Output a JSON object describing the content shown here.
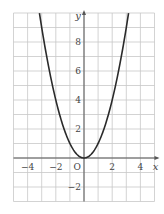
{
  "chart_data": {
    "type": "line",
    "title": "",
    "function": "y = x^2",
    "xlabel": "x",
    "ylabel": "y",
    "origin_label": "O",
    "xlim": [
      -5,
      5
    ],
    "ylim": [
      -3,
      10
    ],
    "grid": true,
    "grid_step": 1,
    "x_ticks": [
      {
        "value": -4,
        "label": "−4"
      },
      {
        "value": -2,
        "label": "−2"
      },
      {
        "value": 2,
        "label": "2"
      },
      {
        "value": 4,
        "label": "4"
      }
    ],
    "y_ticks": [
      {
        "value": 8,
        "label": "8"
      },
      {
        "value": 6,
        "label": "6"
      },
      {
        "value": 4,
        "label": "4"
      },
      {
        "value": 2,
        "label": "2"
      },
      {
        "value": -2,
        "label": "−2"
      }
    ],
    "series": [
      {
        "name": "y = x^2",
        "x": [
          -3.16,
          -3,
          -2.5,
          -2,
          -1.5,
          -1,
          -0.5,
          0,
          0.5,
          1,
          1.5,
          2,
          2.5,
          3,
          3.16
        ],
        "values": [
          10,
          9,
          6.25,
          4,
          2.25,
          1,
          0.25,
          0,
          0.25,
          1,
          2.25,
          4,
          6.25,
          9,
          10
        ]
      }
    ],
    "colors": {
      "grid": "#c8c8c8",
      "axis": "#555555",
      "curve": "#2a2a2a",
      "text": "#444444"
    },
    "legend": null
  }
}
